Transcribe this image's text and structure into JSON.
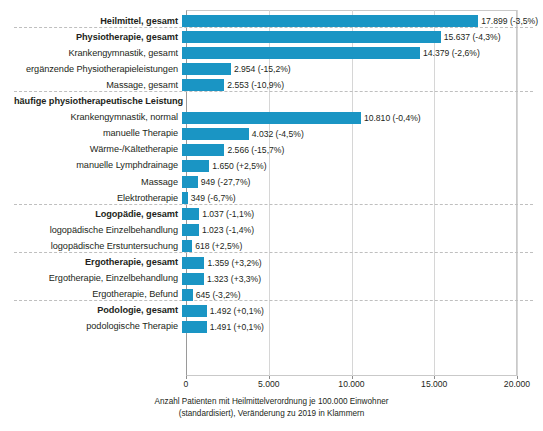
{
  "chart_data": {
    "type": "bar",
    "orientation": "horizontal",
    "title": "",
    "xlabel": "Anzahl Patienten mit Heilmittelverordnung je 100.000 Einwohner (standardisiert), Veränderung zu 2019 in Klammern",
    "ylabel": "",
    "xlim": [
      0,
      20000
    ],
    "xticks": [
      0,
      5000,
      10000,
      15000,
      20000
    ],
    "xticklabels": [
      "0",
      "5.000",
      "10.000",
      "15.000",
      "20.000"
    ],
    "grid": true,
    "legend": "none",
    "bar_color": "#1a95c4",
    "categories": [
      "Heilmittel, gesamt",
      "Physiotherapie, gesamt",
      "Krankengymnastik, gesamt",
      "ergänzende Physiotherapieleistungen",
      "Massage, gesamt",
      "häufige physiotherapeutische Leistung",
      "Krankengymnastik, normal",
      "manuelle Therapie",
      "Wärme-/Kältetherapie",
      "manuelle Lymphdrainage",
      "Massage",
      "Elektrotherapie",
      "Logopädie, gesamt",
      "logopädische Einzelbehandlung",
      "logopädische Erstuntersuchung",
      "Ergotherapie, gesamt",
      "Ergotherapie, Einzelbehandlung",
      "Ergotherapie, Befund",
      "Podologie, gesamt",
      "podologische Therapie"
    ],
    "values": [
      17899,
      15637,
      14379,
      2954,
      2553,
      null,
      10810,
      4032,
      2566,
      1650,
      949,
      349,
      1037,
      1023,
      618,
      1359,
      1323,
      645,
      1492,
      1491
    ],
    "change_pct": [
      "-3,5%",
      "-4,3%",
      "-2,6%",
      "-15,2%",
      "-10,9%",
      null,
      "-0,4%",
      "-4,5%",
      "-15,7%",
      "+2,5%",
      "-27,7%",
      "-6,7%",
      "-1,1%",
      "-1,4%",
      "+2,5%",
      "+3,2%",
      "+3,3%",
      "-3,2%",
      "+0,1%",
      "+0,1%"
    ]
  },
  "axis": {
    "caption_line1": "Anzahl Patienten mit Heilmittelverordnung je 100.000 Einwohner",
    "caption_line2": "(standardisiert), Veränderung zu 2019 in Klammern",
    "ticks": [
      {
        "label": "0",
        "value": 0
      },
      {
        "label": "5.000",
        "value": 5000
      },
      {
        "label": "10.000",
        "value": 10000
      },
      {
        "label": "15.000",
        "value": 15000
      },
      {
        "label": "20.000",
        "value": 20000
      }
    ]
  },
  "rows": [
    {
      "label": "Heilmittel, gesamt",
      "value": 17899,
      "value_text": "17.899 (-3,5%)",
      "bold": true,
      "header": false,
      "sep_after": true
    },
    {
      "label": "Physiotherapie, gesamt",
      "value": 15637,
      "value_text": "15.637 (-4,3%)",
      "bold": true,
      "header": false,
      "sep_after": false
    },
    {
      "label": "Krankengymnastik, gesamt",
      "value": 14379,
      "value_text": "14.379 (-2,6%)",
      "bold": false,
      "header": false,
      "sep_after": false
    },
    {
      "label": "ergänzende Physiotherapieleistungen",
      "value": 2954,
      "value_text": "2.954 (-15,2%)",
      "bold": false,
      "header": false,
      "sep_after": false
    },
    {
      "label": "Massage, gesamt",
      "value": 2553,
      "value_text": "2.553 (-10,9%)",
      "bold": false,
      "header": false,
      "sep_after": true
    },
    {
      "label": "häufige physiotherapeutische Leistung",
      "value": null,
      "value_text": "",
      "bold": true,
      "header": true,
      "sep_after": false
    },
    {
      "label": "Krankengymnastik, normal",
      "value": 10810,
      "value_text": "10.810 (-0,4%)",
      "bold": false,
      "header": false,
      "sep_after": false
    },
    {
      "label": "manuelle Therapie",
      "value": 4032,
      "value_text": "4.032 (-4,5%)",
      "bold": false,
      "header": false,
      "sep_after": false
    },
    {
      "label": "Wärme-/Kältetherapie",
      "value": 2566,
      "value_text": "2.566 (-15,7%)",
      "bold": false,
      "header": false,
      "sep_after": false
    },
    {
      "label": "manuelle Lymphdrainage",
      "value": 1650,
      "value_text": "1.650 (+2,5%)",
      "bold": false,
      "header": false,
      "sep_after": false
    },
    {
      "label": "Massage",
      "value": 949,
      "value_text": "949 (-27,7%)",
      "bold": false,
      "header": false,
      "sep_after": false
    },
    {
      "label": "Elektrotherapie",
      "value": 349,
      "value_text": "349 (-6,7%)",
      "bold": false,
      "header": false,
      "sep_after": true
    },
    {
      "label": "Logopädie, gesamt",
      "value": 1037,
      "value_text": "1.037 (-1,1%)",
      "bold": true,
      "header": false,
      "sep_after": false
    },
    {
      "label": "logopädische Einzelbehandlung",
      "value": 1023,
      "value_text": "1.023 (-1,4%)",
      "bold": false,
      "header": false,
      "sep_after": false
    },
    {
      "label": "logopädische Erstuntersuchung",
      "value": 618,
      "value_text": "618 (+2,5%)",
      "bold": false,
      "header": false,
      "sep_after": true
    },
    {
      "label": "Ergotherapie, gesamt",
      "value": 1359,
      "value_text": "1.359 (+3,2%)",
      "bold": true,
      "header": false,
      "sep_after": false
    },
    {
      "label": "Ergotherapie, Einzelbehandlung",
      "value": 1323,
      "value_text": "1.323 (+3,3%)",
      "bold": false,
      "header": false,
      "sep_after": false
    },
    {
      "label": "Ergotherapie, Befund",
      "value": 645,
      "value_text": "645 (-3,2%)",
      "bold": false,
      "header": false,
      "sep_after": true
    },
    {
      "label": "Podologie, gesamt",
      "value": 1492,
      "value_text": "1.492 (+0,1%)",
      "bold": true,
      "header": false,
      "sep_after": false
    },
    {
      "label": "podologische Therapie",
      "value": 1491,
      "value_text": "1.491 (+0,1%)",
      "bold": false,
      "header": false,
      "sep_after": false
    }
  ],
  "colors": {
    "bar": "#1a95c4",
    "gridline": "#d6d6d6",
    "separator": "#bfbfbf",
    "text": "#231f20"
  }
}
